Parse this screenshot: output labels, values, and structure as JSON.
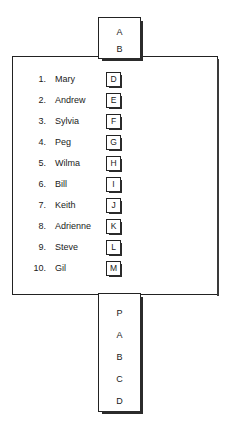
{
  "diagram": {
    "top_node": {
      "name": "top-node",
      "lines": [
        "A",
        "B"
      ]
    },
    "main_panel": {
      "name": "main-list-panel",
      "rows": [
        {
          "index": "1.",
          "name": "Mary",
          "tag": "D"
        },
        {
          "index": "2.",
          "name": "Andrew",
          "tag": "E"
        },
        {
          "index": "3.",
          "name": "Sylvia",
          "tag": "F"
        },
        {
          "index": "4.",
          "name": "Peg",
          "tag": "G"
        },
        {
          "index": "5.",
          "name": "Wilma",
          "tag": "H"
        },
        {
          "index": "6.",
          "name": "Bill",
          "tag": "I"
        },
        {
          "index": "7.",
          "name": "Keith",
          "tag": "J"
        },
        {
          "index": "8.",
          "name": "Adrienne",
          "tag": "K"
        },
        {
          "index": "9.",
          "name": "Steve",
          "tag": "L"
        },
        {
          "index": "10.",
          "name": "Gil",
          "tag": "M"
        }
      ]
    },
    "bottom_node": {
      "name": "bottom-node",
      "lines": [
        "P",
        "A",
        "B",
        "C",
        "D"
      ]
    },
    "colors": {
      "background": "#ffffff",
      "outline": "#222222",
      "shadow": "#2b2b2b",
      "text": "#1a1a1a"
    }
  }
}
